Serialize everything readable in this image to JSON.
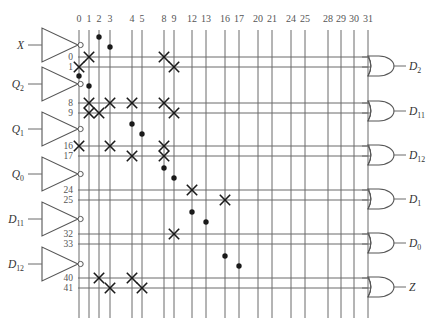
{
  "diagram": {
    "type": "pla-programmable-logic-array",
    "colors": {
      "line": "#6b6b6b",
      "mark": "#1a1a1a",
      "text": "#555555",
      "gate_stroke": "#555555",
      "background": "#ffffff"
    },
    "geometry": {
      "width": 430,
      "height": 328,
      "array_top": 30,
      "array_bottom": 318,
      "col_label_y": 22,
      "buffer_x": 42,
      "buffer_w": 36,
      "gate_x": 368,
      "gate_w": 26
    },
    "inputs": [
      {
        "label": "X",
        "sub": "",
        "y": 45,
        "true_row": 0,
        "comp_row": 1
      },
      {
        "label": "Q",
        "sub": "2",
        "y": 84,
        "true_row": 8,
        "comp_row": 9
      },
      {
        "label": "Q",
        "sub": "1",
        "y": 129,
        "true_row": 16,
        "comp_row": 17
      },
      {
        "label": "Q",
        "sub": "0",
        "y": 174,
        "true_row": 24,
        "comp_row": 25
      },
      {
        "label": "D",
        "sub": "11",
        "y": 219,
        "true_row": 32,
        "comp_row": 33
      },
      {
        "label": "D",
        "sub": "12",
        "y": 264,
        "true_row": 40,
        "comp_row": 41
      }
    ],
    "rows": [
      {
        "id": 0,
        "label": "0",
        "y": 57
      },
      {
        "id": 1,
        "label": "1",
        "y": 67
      },
      {
        "id": 8,
        "label": "8",
        "y": 103
      },
      {
        "id": 9,
        "label": "9",
        "y": 113
      },
      {
        "id": 16,
        "label": "16",
        "y": 146
      },
      {
        "id": 17,
        "label": "17",
        "y": 156
      },
      {
        "id": 24,
        "label": "24",
        "y": 190
      },
      {
        "id": 25,
        "label": "25",
        "y": 200
      },
      {
        "id": 32,
        "label": "32",
        "y": 234
      },
      {
        "id": 33,
        "label": "33",
        "y": 244
      },
      {
        "id": 40,
        "label": "40",
        "y": 278
      },
      {
        "id": 41,
        "label": "41",
        "y": 288
      }
    ],
    "columns": [
      {
        "id": 0,
        "label": "0",
        "x": 79
      },
      {
        "id": 1,
        "label": "1",
        "x": 89
      },
      {
        "id": 2,
        "label": "2",
        "x": 99
      },
      {
        "id": 3,
        "label": "3",
        "x": 110
      },
      {
        "id": 4,
        "label": "4",
        "x": 132
      },
      {
        "id": 5,
        "label": "5",
        "x": 142
      },
      {
        "id": 8,
        "label": "8",
        "x": 164
      },
      {
        "id": 9,
        "label": "9",
        "x": 174
      },
      {
        "id": 12,
        "label": "12",
        "x": 192
      },
      {
        "id": 13,
        "label": "13",
        "x": 206
      },
      {
        "id": 16,
        "label": "16",
        "x": 225
      },
      {
        "id": 17,
        "label": "17",
        "x": 239
      },
      {
        "id": 20,
        "label": "20",
        "x": 258
      },
      {
        "id": 21,
        "label": "21",
        "x": 272
      },
      {
        "id": 24,
        "label": "24",
        "x": 291
      },
      {
        "id": 25,
        "label": "25",
        "x": 305
      },
      {
        "id": 28,
        "label": "28",
        "x": 328
      },
      {
        "id": 29,
        "label": "29",
        "x": 341
      },
      {
        "id": 30,
        "label": "30",
        "x": 354
      },
      {
        "id": 31,
        "label": "31",
        "x": 368
      }
    ],
    "outputs": [
      {
        "label": "D",
        "sub": "2",
        "y": 66,
        "rows": [
          57,
          67
        ]
      },
      {
        "label": "D",
        "sub": "11",
        "y": 111,
        "rows": [
          103,
          113
        ]
      },
      {
        "label": "D",
        "sub": "12",
        "y": 155,
        "rows": [
          146,
          156
        ]
      },
      {
        "label": "D",
        "sub": "1",
        "y": 199,
        "rows": [
          190,
          200
        ]
      },
      {
        "label": "D",
        "sub": "0",
        "y": 243,
        "rows": [
          234,
          244
        ]
      },
      {
        "label": "Z",
        "sub": "",
        "y": 287,
        "rows": [
          278,
          288
        ]
      }
    ],
    "crosses": [
      {
        "col": 0,
        "row": 1
      },
      {
        "col": 1,
        "row": 0
      },
      {
        "col": 8,
        "row": 0
      },
      {
        "col": 9,
        "row": 1
      },
      {
        "col": 1,
        "row": 8
      },
      {
        "col": 1,
        "row": 9
      },
      {
        "col": 2,
        "row": 9
      },
      {
        "col": 3,
        "row": 8
      },
      {
        "col": 4,
        "row": 8
      },
      {
        "col": 8,
        "row": 8
      },
      {
        "col": 9,
        "row": 9
      },
      {
        "col": 0,
        "row": 16
      },
      {
        "col": 3,
        "row": 16
      },
      {
        "col": 4,
        "row": 17
      },
      {
        "col": 8,
        "row": 16
      },
      {
        "col": 8,
        "row": 17
      },
      {
        "col": 12,
        "row": 24
      },
      {
        "col": 16,
        "row": 25
      },
      {
        "col": 9,
        "row": 32
      },
      {
        "col": 2,
        "row": 40
      },
      {
        "col": 3,
        "row": 41
      },
      {
        "col": 4,
        "row": 40
      },
      {
        "col": 5,
        "row": 41
      }
    ],
    "dots": [
      {
        "col": 2,
        "y": 37
      },
      {
        "col": 3,
        "y": 47
      },
      {
        "col": 0,
        "y": 76
      },
      {
        "col": 1,
        "y": 86
      },
      {
        "col": 4,
        "y": 124
      },
      {
        "col": 5,
        "y": 134
      },
      {
        "col": 8,
        "y": 168
      },
      {
        "col": 9,
        "y": 178
      },
      {
        "col": 12,
        "y": 212
      },
      {
        "col": 13,
        "y": 222
      },
      {
        "col": 16,
        "y": 256
      },
      {
        "col": 17,
        "y": 266
      }
    ]
  }
}
